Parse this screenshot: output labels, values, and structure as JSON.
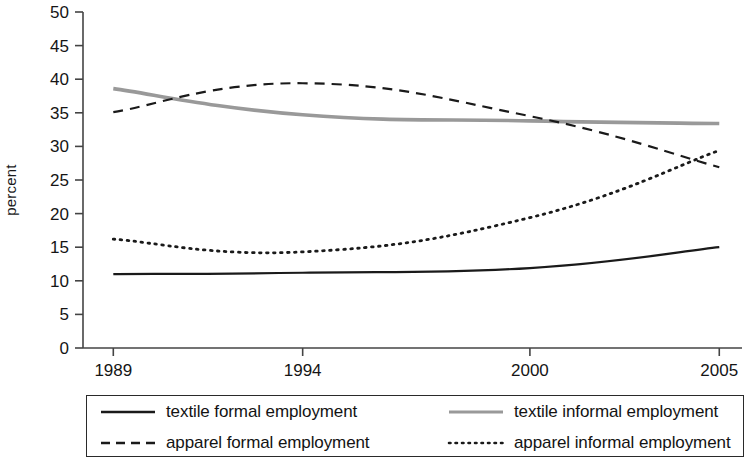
{
  "chart_data": {
    "type": "line",
    "title": "",
    "xlabel": "",
    "ylabel": "percent",
    "x": [
      1989,
      1994,
      2000,
      2005
    ],
    "xtick_labels": [
      "1989",
      "1994",
      "2000",
      "2005"
    ],
    "ytick_labels": [
      "0",
      "5",
      "10",
      "15",
      "20",
      "25",
      "30",
      "35",
      "40",
      "45",
      "50"
    ],
    "ylim": [
      0,
      50
    ],
    "xlim": [
      1988.2,
      2005.6
    ],
    "grid": false,
    "legend_position": "bottom",
    "series": [
      {
        "name": "textile formal employment",
        "style": "solid",
        "color": "#1a1a1a",
        "values": [
          11.0,
          11.2,
          11.9,
          15.0
        ]
      },
      {
        "name": "textile informal employment",
        "style": "solid",
        "color": "#999999",
        "values": [
          38.6,
          34.7,
          33.8,
          33.4
        ]
      },
      {
        "name": "apparel formal employment",
        "style": "dashed",
        "color": "#1a1a1a",
        "values": [
          35.1,
          39.4,
          34.5,
          26.9
        ]
      },
      {
        "name": "apparel informal employment",
        "style": "dotted",
        "color": "#1a1a1a",
        "values": [
          16.2,
          14.3,
          19.4,
          29.4
        ]
      }
    ]
  },
  "axis": {
    "y_label": "percent",
    "y_ticks": [
      "50",
      "45",
      "40",
      "35",
      "30",
      "25",
      "20",
      "15",
      "10",
      "5",
      "0"
    ],
    "x_ticks": [
      "1989",
      "1994",
      "2000",
      "2005"
    ]
  },
  "legend": {
    "items": [
      {
        "label": "textile formal employment",
        "style": "solid",
        "color": "#1a1a1a"
      },
      {
        "label": "textile informal employment",
        "style": "solid",
        "color": "#999999"
      },
      {
        "label": "apparel formal employment",
        "style": "dashed",
        "color": "#1a1a1a"
      },
      {
        "label": "apparel informal employment",
        "style": "dotted",
        "color": "#1a1a1a"
      }
    ]
  }
}
